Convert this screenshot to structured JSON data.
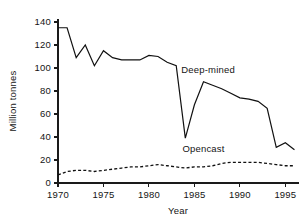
{
  "chart_data": {
    "type": "line",
    "title": "",
    "xlabel": "Year",
    "ylabel": "Million tonnes",
    "xlim": [
      1970,
      1996.5
    ],
    "ylim": [
      0,
      145
    ],
    "grid": false,
    "legend_position": "inline-annotation",
    "x_ticks": [
      1970,
      1975,
      1980,
      1985,
      1990,
      1995
    ],
    "x_tick_labels": [
      "1970",
      "1975",
      "1980",
      "1985",
      "1990",
      "1995"
    ],
    "y_ticks": [
      0,
      20,
      40,
      60,
      80,
      100,
      120,
      140
    ],
    "y_tick_labels": [
      "0",
      "20",
      "40",
      "60",
      "80",
      "100",
      "120",
      "140"
    ],
    "x": [
      1970,
      1971,
      1972,
      1973,
      1974,
      1975,
      1976,
      1977,
      1978,
      1979,
      1980,
      1981,
      1982,
      1983,
      1984,
      1985,
      1986,
      1987,
      1988,
      1989,
      1990,
      1991,
      1992,
      1993,
      1994,
      1995,
      1996
    ],
    "series": [
      {
        "name": "Deep-mined",
        "style": "solid",
        "label": "Deep-mined",
        "values": [
          135,
          135,
          109,
          120,
          102,
          115,
          109,
          107,
          107,
          107,
          111,
          110,
          105,
          102,
          39,
          68,
          88,
          85,
          82,
          78,
          74,
          73,
          71,
          65,
          31,
          35,
          29
        ]
      },
      {
        "name": "Opencast",
        "style": "dashed",
        "label": "Opencast",
        "values": [
          7,
          10,
          11,
          11,
          10,
          11,
          12,
          13,
          14,
          14,
          15,
          16,
          15,
          14,
          13,
          14,
          14,
          15,
          17,
          18,
          18,
          18,
          18,
          17,
          16,
          15,
          15
        ]
      }
    ],
    "annotations": [
      {
        "text": "Deep-mined",
        "x": 1986.5,
        "y": 96
      },
      {
        "text": "Opencast",
        "x": 1986.0,
        "y": 27
      }
    ],
    "colors": {
      "line": "#111111",
      "axis": "#1a1a1a",
      "text": "#141414",
      "background": "#ffffff"
    }
  }
}
